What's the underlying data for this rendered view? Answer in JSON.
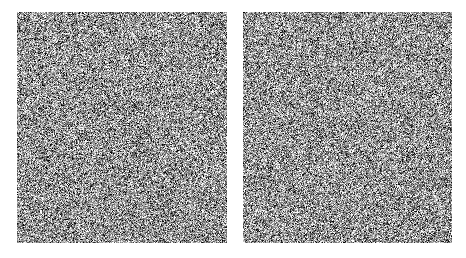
{
  "figure": {
    "type": "image-pair",
    "background_color": "#ffffff",
    "canvas_width": 466,
    "canvas_height": 258,
    "title": "",
    "caption": "",
    "panel_count": 2,
    "panels": [
      {
        "id": "left",
        "label": "",
        "x": 17,
        "y": 12,
        "width": 210,
        "height": 231,
        "content": "grayscale salt-and-pepper random noise",
        "mean_gray": "#9a9a9a",
        "min_gray": "#000000",
        "max_gray": "#ffffff",
        "grain_px": 1,
        "seed": 12345
      },
      {
        "id": "right",
        "label": "",
        "x": 243,
        "y": 12,
        "width": 209,
        "height": 231,
        "content": "grayscale salt-and-pepper random noise",
        "mean_gray": "#9a9a9a",
        "min_gray": "#000000",
        "max_gray": "#ffffff",
        "grain_px": 1,
        "seed": 67890
      }
    ],
    "gap": {
      "x": 227,
      "y": 12,
      "width": 16,
      "height": 231,
      "color": "#ffffff"
    }
  }
}
